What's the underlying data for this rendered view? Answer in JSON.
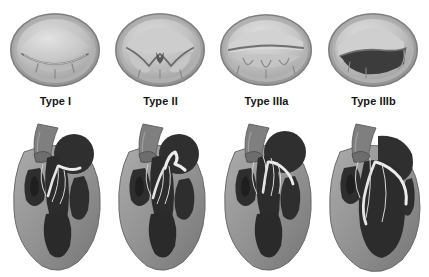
{
  "figure": {
    "background_color": "#ffffff",
    "columns": 4,
    "rows": [
      {
        "name": "valve-en-face-row",
        "description": "Surgeon's view of the mitral valve orifice"
      },
      {
        "name": "heart-cross-section-row",
        "description": "Four-chamber cross-section of the heart"
      }
    ]
  },
  "palette": {
    "background": "#ffffff",
    "label_text": "#161616",
    "myocardium_light": "#a6a6a6",
    "myocardium_mid": "#8d8d8d",
    "myocardium_dark": "#6f6f6f",
    "chamber_dark": "#2f2f2f",
    "chamber_darker": "#242424",
    "leaflet_white": "#ededed",
    "valve_ring_outer": "#9a9a9a",
    "valve_ring_inner": "#b3b3b3",
    "leaflet_tissue": "#c2c2c2",
    "leaflet_highlight": "#d8d8d8",
    "orifice_gap": "#3a3a3a",
    "vessel_gray": "#7b7b7b"
  },
  "types": [
    {
      "id": "type-1",
      "label": "Type I",
      "valve": {
        "name": "valve-type-1",
        "leaflet_motion": "normal",
        "orifice": "closed",
        "orifice_shape": "coaptation-line",
        "description": "Normal leaflet motion; annular dilatation or leaflet perforation"
      },
      "heart": {
        "name": "heart-type-1",
        "leaflet_position": "normal-coaptation",
        "ventricle": "normal",
        "description": "Leaflets coapt at annular plane"
      }
    },
    {
      "id": "type-2",
      "label": "Type II",
      "valve": {
        "name": "valve-type-2",
        "leaflet_motion": "excessive",
        "orifice": "central-notch",
        "orifice_shape": "w-shaped-cleft",
        "description": "Leaflet prolapse or flail segment"
      },
      "heart": {
        "name": "heart-type-2",
        "leaflet_position": "prolapse-into-atrium",
        "ventricle": "normal",
        "description": "Free edge overrides annular plane into left atrium"
      }
    },
    {
      "id": "type-3a",
      "label": "Type IIIa",
      "valve": {
        "name": "valve-type-3a",
        "leaflet_motion": "restricted-systole-and-diastole",
        "orifice": "slit-gap",
        "orifice_shape": "linear-slit",
        "description": "Rheumatic: thickened, restricted leaflets"
      },
      "heart": {
        "name": "heart-type-3a",
        "leaflet_position": "restricted-retracted-chordae",
        "ventricle": "normal",
        "description": "Shortened, thickened chordae restrict both leaflets"
      }
    },
    {
      "id": "type-3b",
      "label": "Type IIIb",
      "valve": {
        "name": "valve-type-3b",
        "leaflet_motion": "restricted-systole",
        "orifice": "large-triangular-gap",
        "orifice_shape": "crescent-defect",
        "description": "Ischaemic / functional: leaflet tethering"
      },
      "heart": {
        "name": "heart-type-3b",
        "leaflet_position": "tethered-apically",
        "ventricle": "dilated",
        "description": "Dilated left ventricle tethers leaflets apically"
      }
    }
  ]
}
